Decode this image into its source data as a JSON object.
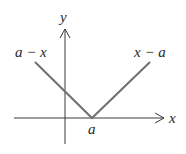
{
  "diagram": {
    "axes": {
      "x_label": "x",
      "y_label": "y",
      "origin_px": [
        65,
        118
      ]
    },
    "vertex_label": "a",
    "left_branch_label": "a − x",
    "right_branch_label": "x − a",
    "colors": {
      "axis": "#3a3a3a",
      "graph_line": "#707070",
      "text": "#2a2a2a"
    }
  }
}
